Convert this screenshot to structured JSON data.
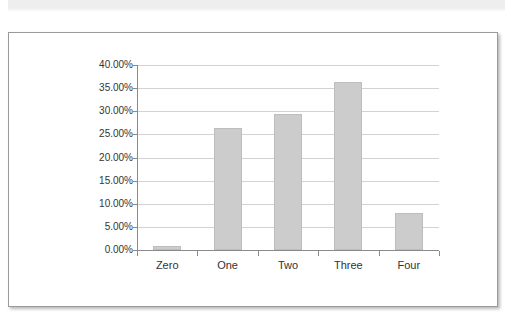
{
  "chart_data": {
    "type": "bar",
    "title": "",
    "subtitle": "",
    "xlabel": "",
    "ylabel": "",
    "categories": [
      "Zero",
      "One",
      "Two",
      "Three",
      "Four"
    ],
    "values": [
      0.9,
      26.4,
      29.3,
      36.3,
      8.1
    ],
    "value_labels": [
      "0.90%",
      "26.40%",
      "29.30%",
      "36.30%",
      "8.10%"
    ],
    "series": [
      {
        "name": "Series 1",
        "values": [
          0.9,
          26.4,
          29.3,
          36.3,
          8.1
        ]
      }
    ],
    "ylim": [
      0,
      40
    ],
    "ytick_values": [
      0,
      5,
      10,
      15,
      20,
      25,
      30,
      35,
      40
    ],
    "ytick_labels": [
      "0.00%",
      "5.00%",
      "10.00%",
      "15.00%",
      "20.00%",
      "25.00%",
      "30.00%",
      "35.00%",
      "40.00%"
    ],
    "grid": true,
    "grid_axis": "y",
    "legend": false,
    "legend_position": "none",
    "bar_color": "#cccccc",
    "bar_border_color": "#bdbdbd",
    "gridline_color": "#d2d2d2",
    "axis_color": "#8a8a8a",
    "text_color": "#333333",
    "background_color": "#ffffff"
  },
  "card": {
    "border_color": "#9a9a9a",
    "background_color": "#ffffff"
  },
  "top_band": {
    "color": "#eeeeee"
  }
}
